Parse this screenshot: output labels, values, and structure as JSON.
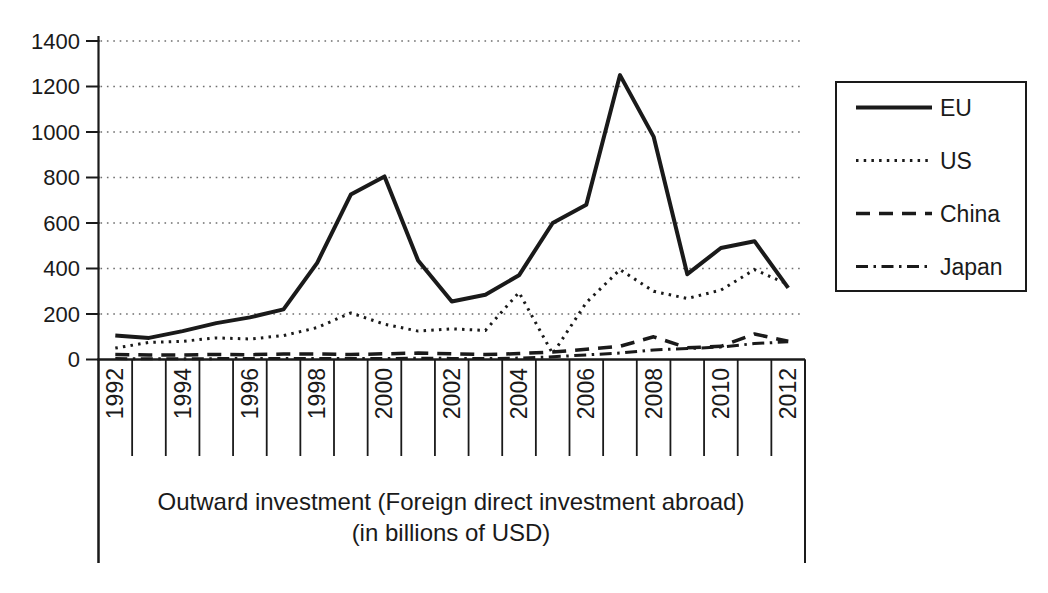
{
  "chart_data": {
    "type": "line",
    "title": "Outward investment (Foreign direct investment abroad)",
    "subtitle": "(in billions of USD)",
    "x_years": [
      1992,
      1993,
      1994,
      1995,
      1996,
      1997,
      1998,
      1999,
      2000,
      2001,
      2002,
      2003,
      2004,
      2005,
      2006,
      2007,
      2008,
      2009,
      2010,
      2011,
      2012
    ],
    "x_axis_labels": [
      "1992",
      "1994",
      "1996",
      "1998",
      "2000",
      "2002",
      "2004",
      "2006",
      "2008",
      "2010",
      "2012"
    ],
    "ylim": [
      0,
      1400
    ],
    "yticks": [
      0,
      200,
      400,
      600,
      800,
      1000,
      1200,
      1400
    ],
    "grid": "horizontal-dotted",
    "legend_position": "right",
    "series": [
      {
        "name": "EU",
        "line_style": "solid",
        "values": [
          105,
          95,
          125,
          160,
          185,
          220,
          425,
          725,
          805,
          435,
          255,
          285,
          370,
          600,
          680,
          1250,
          980,
          375,
          490,
          520,
          315
        ]
      },
      {
        "name": "US",
        "line_style": "dotted",
        "values": [
          50,
          75,
          80,
          95,
          90,
          105,
          140,
          205,
          155,
          125,
          135,
          128,
          295,
          25,
          250,
          395,
          300,
          268,
          305,
          395,
          330
        ]
      },
      {
        "name": "China",
        "line_style": "dashed",
        "values": [
          22,
          20,
          20,
          22,
          21,
          24,
          24,
          22,
          25,
          28,
          25,
          22,
          26,
          33,
          45,
          58,
          100,
          52,
          58,
          112,
          80
        ]
      },
      {
        "name": "Japan",
        "line_style": "dash-dot",
        "values": [
          4,
          3,
          3,
          4,
          4,
          5,
          5,
          4,
          4,
          6,
          5,
          4,
          6,
          12,
          20,
          28,
          42,
          48,
          55,
          70,
          78
        ]
      }
    ]
  },
  "colors": {
    "ink": "#1a1a1a",
    "grid_dots": "#6e6e6e",
    "background": "#ffffff"
  }
}
